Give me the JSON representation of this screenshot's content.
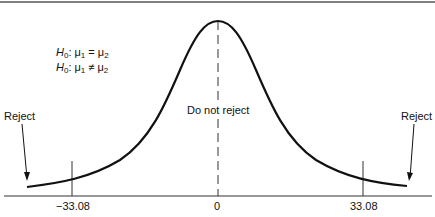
{
  "hypotheses": {
    "null": {
      "h": "H",
      "h_sub": "0",
      "rel": ": μ",
      "a_sub": "1",
      "op": " = μ",
      "b_sub": "2"
    },
    "alt": {
      "h": "H",
      "h_sub": "0",
      "rel": ": μ",
      "a_sub": "1",
      "op": " ≠ μ",
      "b_sub": "2"
    }
  },
  "regions": {
    "center": "Do not reject",
    "left": "Reject",
    "right": "Reject"
  },
  "axis": {
    "ticks": [
      "−33.08",
      "0",
      "33.08"
    ]
  },
  "colors": {
    "curve": "#111111",
    "axis": "#333333"
  }
}
